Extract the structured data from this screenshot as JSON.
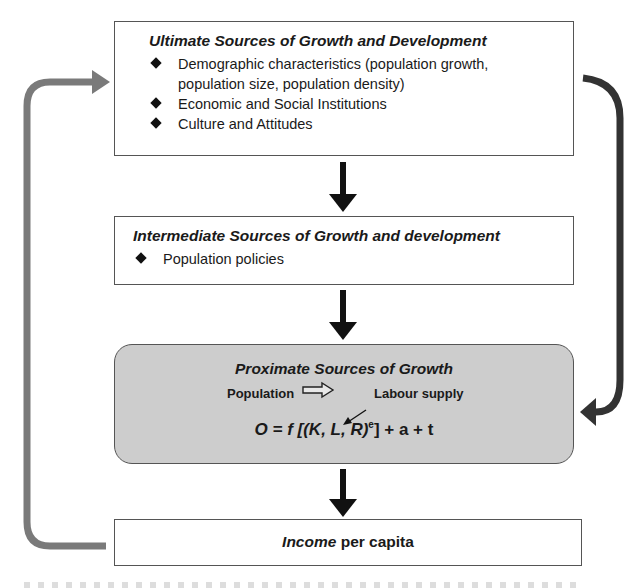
{
  "ultimate": {
    "title": "Ultimate Sources of Growth and Development",
    "bullets": [
      "Demographic characteristics (population growth,",
      "population size, population density)",
      "Economic and Social Institutions",
      "Culture and Attitudes"
    ]
  },
  "intermediate": {
    "title": "Intermediate Sources of Growth and development",
    "bullets": [
      "Population policies"
    ]
  },
  "proximate": {
    "title": "Proximate Sources of Growth",
    "flow_from": "Population",
    "flow_to": "Labour supply",
    "formula_main": "O = f [(K, L, R)",
    "formula_sup": "e",
    "formula_tail": "] + a + t"
  },
  "income": {
    "italic": "Income",
    "rest": " per capita"
  },
  "colors": {
    "feedback_left_arrow": "#7a7a7a",
    "feedback_right_arrow": "#333333",
    "proximate_fill": "#cdcdcd",
    "down_arrow": "#111111"
  }
}
